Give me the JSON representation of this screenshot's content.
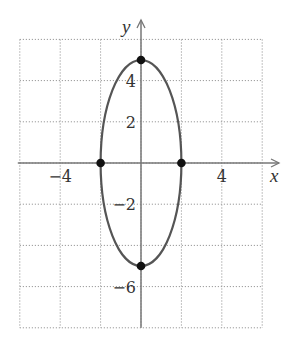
{
  "chart_data": {
    "type": "line",
    "title": "",
    "xlabel": "x",
    "ylabel": "y",
    "xlim": [
      -6,
      6
    ],
    "ylim": [
      -8,
      6
    ],
    "grid": true,
    "grid_step": 2,
    "x_ticks": [
      {
        "value": -4,
        "label": "−4"
      },
      {
        "value": 4,
        "label": "4"
      }
    ],
    "y_ticks": [
      {
        "value": 4,
        "label": "4"
      },
      {
        "value": 2,
        "label": "2"
      },
      {
        "value": -2,
        "label": "−2"
      },
      {
        "value": -6,
        "label": "−6"
      }
    ],
    "series": [
      {
        "name": "ellipse",
        "kind": "ellipse",
        "center": [
          0,
          0
        ],
        "semi_axis_x": 2,
        "semi_axis_y": 5,
        "color": "#555555"
      }
    ],
    "points": [
      {
        "x": 0,
        "y": 5
      },
      {
        "x": 0,
        "y": -5
      },
      {
        "x": -2,
        "y": 0
      },
      {
        "x": 2,
        "y": 0
      }
    ],
    "colors": {
      "grid": "#9a9a9a",
      "axis": "#777777",
      "curve": "#555555",
      "point": "#111111"
    }
  }
}
